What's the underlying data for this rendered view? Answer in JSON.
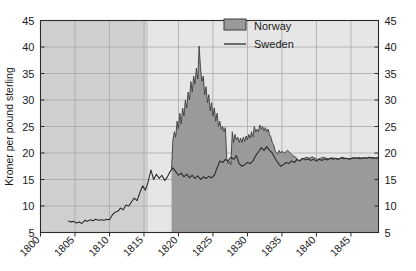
{
  "chart_data": {
    "type": "area",
    "title": "",
    "xlabel": "",
    "ylabel": "Kroner per pound sterling",
    "xlim": [
      1800,
      1849
    ],
    "ylim": [
      5,
      45
    ],
    "xticks": [
      1800,
      1805,
      1810,
      1815,
      1820,
      1825,
      1830,
      1835,
      1840,
      1845
    ],
    "xtick_labels": [
      "1800",
      "1805",
      "1810",
      "1815",
      "1820",
      "1825",
      "1830",
      "1835",
      "1840",
      "1845"
    ],
    "yticks": [
      5,
      10,
      15,
      20,
      25,
      30,
      35,
      40,
      45
    ],
    "ytick_labels": [
      "5",
      "10",
      "15",
      "20",
      "25",
      "30",
      "35",
      "40",
      "45"
    ],
    "ytick_labels_right": [
      "5",
      "10",
      "15",
      "20",
      "25",
      "30",
      "35",
      "40",
      "45"
    ],
    "grid": true,
    "legend_position": "top-right",
    "colors": {
      "norway_fill": "#9a9a9a",
      "norway_edge": "#3c3c3c",
      "sweden_line": "#2b2b2b",
      "plot_background_early": "#cfcfcf",
      "plot_background_mid": "#e6e6e6",
      "grid_line": "#a8a8a8",
      "axis": "#2b2b2b"
    },
    "series": [
      {
        "name": "Norway",
        "style": "filled-area",
        "x_start": 1819.0,
        "x_end": 1849.0,
        "x": [
          1819.0,
          1819.2,
          1819.4,
          1819.6,
          1819.8,
          1820.0,
          1820.2,
          1820.4,
          1820.6,
          1820.8,
          1821.0,
          1821.2,
          1821.4,
          1821.6,
          1821.8,
          1822.0,
          1822.2,
          1822.4,
          1822.6,
          1822.8,
          1823.0,
          1823.2,
          1823.4,
          1823.6,
          1823.8,
          1824.0,
          1824.2,
          1824.4,
          1824.6,
          1824.8,
          1825.0,
          1825.2,
          1825.4,
          1825.6,
          1825.8,
          1826.0,
          1826.2,
          1826.4,
          1826.6,
          1826.8,
          1827.0,
          1827.2,
          1827.4,
          1827.6,
          1827.8,
          1828.0,
          1828.2,
          1828.4,
          1828.6,
          1828.8,
          1829.0,
          1829.2,
          1829.4,
          1829.6,
          1829.8,
          1830.0,
          1830.2,
          1830.4,
          1830.6,
          1830.8,
          1831.0,
          1831.2,
          1831.4,
          1831.6,
          1831.8,
          1832.0,
          1832.2,
          1832.4,
          1832.6,
          1832.8,
          1833.0,
          1833.2,
          1833.4,
          1833.6,
          1833.8,
          1834.0,
          1834.2,
          1834.4,
          1834.6,
          1834.8,
          1835.0,
          1835.4,
          1835.8,
          1836.2,
          1836.6,
          1837.0,
          1837.4,
          1837.8,
          1838.2,
          1838.6,
          1839.0,
          1839.4,
          1839.8,
          1840.2,
          1840.6,
          1841.0,
          1841.4,
          1841.8,
          1842.2,
          1842.6,
          1843.0,
          1843.4,
          1843.8,
          1844.2,
          1844.6,
          1845.0,
          1845.4,
          1845.8,
          1846.2,
          1846.6,
          1847.0,
          1847.4,
          1847.8,
          1848.2,
          1848.6,
          1849.0
        ],
        "values": [
          17.0,
          22.5,
          24.0,
          23.0,
          26.0,
          24.5,
          27.5,
          25.5,
          28.5,
          27.0,
          30.0,
          28.5,
          31.5,
          30.0,
          33.5,
          31.5,
          34.5,
          33.0,
          36.0,
          34.0,
          40.2,
          36.0,
          33.5,
          34.5,
          31.0,
          32.5,
          29.5,
          31.0,
          28.0,
          29.5,
          27.0,
          28.5,
          26.0,
          27.5,
          25.0,
          26.0,
          24.5,
          25.0,
          24.0,
          24.8,
          19.0,
          18.0,
          18.5,
          17.8,
          24.0,
          22.0,
          23.5,
          22.5,
          23.0,
          22.0,
          22.8,
          22.0,
          23.0,
          22.2,
          23.2,
          22.5,
          23.5,
          22.8,
          24.0,
          23.0,
          25.0,
          24.0,
          24.5,
          24.0,
          25.3,
          24.5,
          25.0,
          24.2,
          24.8,
          24.0,
          24.5,
          23.5,
          23.0,
          22.0,
          21.5,
          20.5,
          20.0,
          19.8,
          20.5,
          20.0,
          20.3,
          20.0,
          20.5,
          20.0,
          19.5,
          19.2,
          18.5,
          18.8,
          19.0,
          19.2,
          19.0,
          19.3,
          19.0,
          18.8,
          19.0,
          19.2,
          19.0,
          18.9,
          19.1,
          19.0,
          18.8,
          19.0,
          19.2,
          19.0,
          18.9,
          19.0,
          19.1,
          19.0,
          19.2,
          19.0,
          19.1,
          19.0,
          19.2,
          19.1,
          19.0,
          19.2
        ]
      },
      {
        "name": "Sweden",
        "style": "line",
        "x_start": 1804.0,
        "x_end": 1849.0,
        "x": [
          1804.0,
          1804.4,
          1804.8,
          1805.2,
          1805.6,
          1806.0,
          1806.4,
          1806.8,
          1807.2,
          1807.6,
          1808.0,
          1808.4,
          1808.8,
          1809.2,
          1809.6,
          1810.0,
          1810.4,
          1810.8,
          1811.2,
          1811.6,
          1812.0,
          1812.4,
          1812.8,
          1813.2,
          1813.6,
          1814.0,
          1814.4,
          1814.8,
          1815.2,
          1815.6,
          1816.0,
          1816.4,
          1816.8,
          1817.2,
          1817.6,
          1818.0,
          1818.4,
          1818.8,
          1819.2,
          1819.6,
          1820.0,
          1820.4,
          1820.8,
          1821.2,
          1821.6,
          1822.0,
          1822.4,
          1822.8,
          1823.2,
          1823.6,
          1824.0,
          1824.4,
          1824.8,
          1825.2,
          1825.6,
          1826.0,
          1826.4,
          1826.8,
          1827.2,
          1827.6,
          1828.0,
          1828.4,
          1828.8,
          1829.2,
          1829.6,
          1830.0,
          1830.4,
          1830.8,
          1831.2,
          1831.6,
          1832.0,
          1832.4,
          1832.8,
          1833.2,
          1833.6,
          1834.0,
          1834.4,
          1834.8,
          1835.2,
          1835.6,
          1836.0,
          1836.4,
          1836.8,
          1837.2,
          1837.6,
          1838.0,
          1838.4,
          1838.8,
          1839.2,
          1839.6,
          1840.0,
          1840.4,
          1840.8,
          1841.2,
          1841.6,
          1842.0,
          1842.4,
          1842.8,
          1843.2,
          1843.6,
          1844.0,
          1844.4,
          1844.8,
          1845.2,
          1845.6,
          1846.0,
          1846.4,
          1846.8,
          1847.2,
          1847.6,
          1848.0,
          1848.4,
          1848.8,
          1849.0
        ],
        "values": [
          7.2,
          7.0,
          7.1,
          6.8,
          7.0,
          6.7,
          7.3,
          7.1,
          7.4,
          7.2,
          7.5,
          7.3,
          7.4,
          7.3,
          7.5,
          7.4,
          8.3,
          8.8,
          9.0,
          9.6,
          9.3,
          10.2,
          10.0,
          10.8,
          11.5,
          11.0,
          12.5,
          13.8,
          13.0,
          14.5,
          16.8,
          15.0,
          16.0,
          15.2,
          15.8,
          14.8,
          15.5,
          16.5,
          17.2,
          16.5,
          15.8,
          16.2,
          15.5,
          16.0,
          15.3,
          15.8,
          15.2,
          15.7,
          15.0,
          15.5,
          15.2,
          15.6,
          15.3,
          15.8,
          17.2,
          18.5,
          18.2,
          18.8,
          18.5,
          19.2,
          18.8,
          19.5,
          18.0,
          17.5,
          17.8,
          18.2,
          18.0,
          18.5,
          19.5,
          20.2,
          21.0,
          20.5,
          21.2,
          20.5,
          20.0,
          19.0,
          18.2,
          17.5,
          17.8,
          18.2,
          18.0,
          18.5,
          18.2,
          18.8,
          18.5,
          19.0,
          18.7,
          18.9,
          18.6,
          18.8,
          18.5,
          18.8,
          18.6,
          18.9,
          18.7,
          19.0,
          18.8,
          19.0,
          18.8,
          19.1,
          18.9,
          19.0,
          18.8,
          19.0,
          19.1,
          19.0,
          18.9,
          19.1,
          19.0,
          19.2,
          19.0,
          19.1,
          19.0,
          19.2
        ]
      }
    ],
    "background_bands": [
      {
        "x_start": 1800,
        "x_end": 1815.6,
        "shade": "dark"
      },
      {
        "x_start": 1815.6,
        "x_end": 1819.0,
        "shade": "light"
      }
    ],
    "legend": [
      {
        "label": "Norway",
        "marker": "filled-swatch"
      },
      {
        "label": "Sweden",
        "marker": "line"
      }
    ]
  }
}
